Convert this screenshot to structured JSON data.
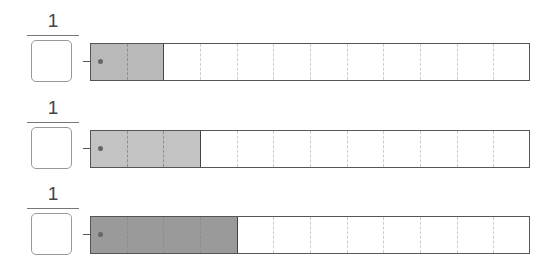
{
  "rows": [
    {
      "numerator": "1",
      "denominator": "",
      "segments": 12,
      "shaded": 2,
      "fill_color": "#b9b9b9",
      "top": 10
    },
    {
      "numerator": "1",
      "denominator": "",
      "segments": 12,
      "shaded": 3,
      "fill_color": "#c3c3c3",
      "top": 97
    },
    {
      "numerator": "1",
      "denominator": "",
      "segments": 12,
      "shaded": 4,
      "fill_color": "#9a9a9a",
      "top": 183
    }
  ]
}
